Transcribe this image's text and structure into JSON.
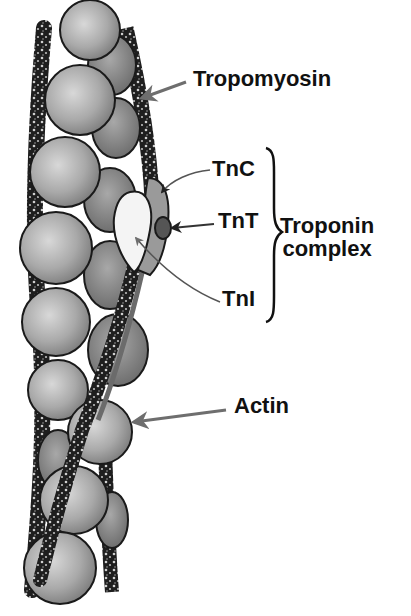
{
  "diagram": {
    "labels": {
      "tropomyosin": "Tropomyosin",
      "tnc": "TnC",
      "tnt": "TnT",
      "tni": "TnI",
      "troponin_complex_line1": "Troponin",
      "troponin_complex_line2": "complex",
      "actin": "Actin"
    },
    "components": [
      {
        "name": "Actin",
        "shape": "chain of grey spheres"
      },
      {
        "name": "Tropomyosin",
        "shape": "twisted dark speckled strands"
      },
      {
        "name": "Troponin complex",
        "subunits": [
          "TnC",
          "TnT",
          "TnI"
        ]
      }
    ],
    "colors": {
      "background": "#ffffff",
      "actin_fill": "#a8a8a8",
      "actin_outline": "#1a1a1a",
      "tropomyosin": "#2a2a2a",
      "tnc": "#9a9a9a",
      "tnt": "#555555",
      "tni": "#f4f4f4",
      "arrow": "#6e6e6e",
      "text": "#111111"
    }
  }
}
